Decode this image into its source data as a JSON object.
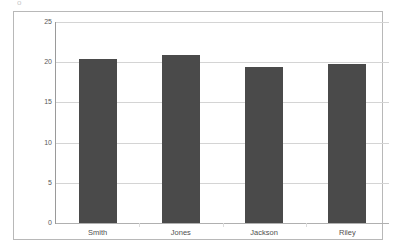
{
  "artifact": {
    "top_glyph": "o"
  },
  "chart_data": {
    "type": "bar",
    "title": "",
    "subtitle": "",
    "xlabel": "",
    "ylabel": "",
    "categories": [
      "Smith",
      "Jones",
      "Jackson",
      "Riley"
    ],
    "values": [
      20.4,
      20.9,
      19.4,
      19.8
    ],
    "series": [
      {
        "name": "",
        "values": [
          20.4,
          20.9,
          19.4,
          19.8
        ]
      }
    ],
    "ylim": [
      0,
      25
    ],
    "ytick_labels": [
      "0",
      "5",
      "10",
      "15",
      "20",
      "25"
    ],
    "ytick_values": [
      0,
      5,
      10,
      15,
      20,
      25
    ],
    "xtick_labels": [
      "Smith",
      "Jones",
      "Jackson",
      "Riley"
    ],
    "grid": true,
    "grid_axis": "y",
    "legend": false,
    "legend_position": "none",
    "bar_color": "#4a4a4a",
    "gridline_color": "#d4d4d4",
    "axis_color": "#9a9a9a",
    "plot_background": "#ffffff",
    "frame_color": "#b8b8b8",
    "annotations": []
  }
}
